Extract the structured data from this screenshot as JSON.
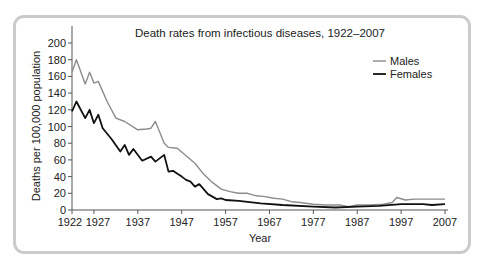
{
  "chart_data": {
    "type": "line",
    "title": "Death rates from infectious diseases, 1922–2007",
    "xlabel": "Year",
    "ylabel": "Deaths per 100,000 population",
    "xlim": [
      1922,
      2007
    ],
    "ylim": [
      0,
      200
    ],
    "x_ticks": [
      1922,
      1927,
      1937,
      1947,
      1957,
      1967,
      1977,
      1987,
      1997,
      2007
    ],
    "y_ticks": [
      0,
      20,
      40,
      60,
      80,
      100,
      120,
      140,
      160,
      180,
      200
    ],
    "grid": false,
    "legend_position": "upper right",
    "series": [
      {
        "name": "Males",
        "color": "#8c8c8c",
        "x": [
          1922,
          1923,
          1925,
          1926,
          1927,
          1928,
          1930,
          1932,
          1934,
          1937,
          1939,
          1940,
          1941,
          1943,
          1944,
          1946,
          1948,
          1950,
          1952,
          1954,
          1956,
          1958,
          1960,
          1962,
          1964,
          1966,
          1968,
          1970,
          1972,
          1974,
          1977,
          1980,
          1983,
          1985,
          1987,
          1990,
          1993,
          1995,
          1996,
          1998,
          2000,
          2003,
          2007
        ],
        "values": [
          165,
          180,
          151,
          165,
          152,
          154,
          130,
          110,
          106,
          96,
          97,
          98,
          106,
          80,
          75,
          74,
          65,
          56,
          43,
          33,
          25,
          22,
          20,
          20,
          17,
          16,
          14,
          13,
          10,
          9,
          7,
          6,
          6,
          4,
          6,
          6,
          7,
          9,
          15,
          12,
          13,
          13,
          13
        ]
      },
      {
        "name": "Females",
        "color": "#111111",
        "x": [
          1922,
          1923,
          1925,
          1926,
          1927,
          1928,
          1929,
          1931,
          1933,
          1934,
          1935,
          1936,
          1938,
          1940,
          1941,
          1943,
          1944,
          1945,
          1947,
          1948,
          1949,
          1950,
          1951,
          1953,
          1955,
          1956,
          1957,
          1960,
          1965,
          1970,
          1977,
          1982,
          1987,
          1992,
          1997,
          2002,
          2004,
          2007
        ],
        "values": [
          118,
          130,
          110,
          120,
          104,
          114,
          98,
          85,
          70,
          78,
          66,
          73,
          59,
          64,
          58,
          66,
          46,
          47,
          40,
          36,
          34,
          28,
          31,
          19,
          13,
          14,
          12,
          11,
          8,
          6,
          4,
          3,
          4,
          5,
          7,
          7,
          6,
          7
        ]
      }
    ]
  }
}
